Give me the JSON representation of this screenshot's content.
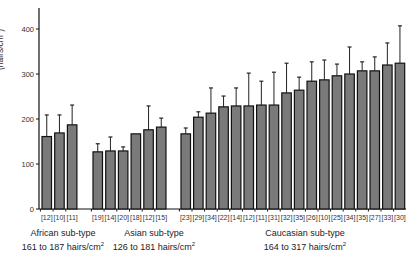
{
  "chart_data": {
    "type": "bar",
    "title": "",
    "xlabel": "",
    "ylabel": "(hairs/cm²)",
    "ylim": [
      0,
      450
    ],
    "yticks": [
      0,
      100,
      200,
      300,
      400
    ],
    "grid": false,
    "legend": null,
    "bar_color": "#7a7a7a",
    "groups": [
      {
        "name": "African sub-type",
        "range_label": "161 to 187 hairs/cm²",
        "categories": [
          "[12]",
          "[10]",
          "[11]"
        ],
        "values": [
          161,
          169,
          187
        ],
        "error_upper": [
          209,
          209,
          231
        ]
      },
      {
        "name": "Asian sub-type",
        "range_label": "126 to 181 hairs/cm²",
        "categories": [
          "[19]",
          "[14]",
          "[20]",
          "[18]",
          "[12]",
          "[15]"
        ],
        "values": [
          127,
          129,
          129,
          167,
          176,
          182
        ],
        "error_upper": [
          145,
          160,
          138,
          null,
          229,
          202
        ]
      },
      {
        "name": "Caucasian sub-type",
        "range_label": "164 to 317 hairs/cm²",
        "categories": [
          "[23]",
          "[29]",
          "[34]",
          "[22]",
          "[14]",
          "[12]",
          "[11]",
          "[31]",
          "[32]",
          "[35]",
          "[26]",
          "[10]",
          "[25]",
          "[34]",
          "[35]",
          "[27]",
          "[33]",
          "[30]"
        ],
        "values": [
          167,
          204,
          213,
          227,
          229,
          229,
          231,
          231,
          258,
          264,
          284,
          287,
          296,
          300,
          307,
          307,
          320,
          324
        ],
        "error_upper": [
          180,
          216,
          269,
          251,
          269,
          302,
          284,
          304,
          324,
          293,
          327,
          331,
          322,
          360,
          327,
          338,
          369,
          407
        ]
      }
    ]
  },
  "labels": {
    "ylabel": "(hairs/cm",
    "ylabel_sup": "2",
    "ylabel_close": ")",
    "groups": [
      {
        "name": "African sub-type",
        "range": "161 to 187 hairs/cm",
        "sup": "2"
      },
      {
        "name": "Asian sub-type",
        "range": "126  to 181 hairs/cm",
        "sup": "2"
      },
      {
        "name": "Caucasian sub-type",
        "range": "164 to 317 hairs/cm",
        "sup": "2"
      }
    ]
  }
}
